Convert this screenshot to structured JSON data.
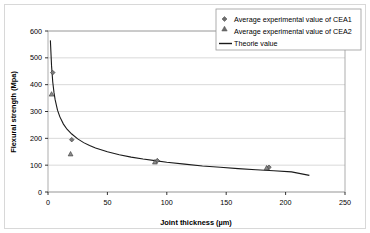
{
  "chart_data": {
    "type": "scatter",
    "title": "",
    "xlabel": "Joint thickness (µm)",
    "ylabel": "Flexural strength (Mpa)",
    "xlim": [
      0,
      250
    ],
    "ylim": [
      0,
      600
    ],
    "xticks": [
      "0",
      "50",
      "100",
      "150",
      "200",
      "250"
    ],
    "yticks": [
      "0",
      "100",
      "200",
      "300",
      "400",
      "500",
      "600"
    ],
    "grid": "horizontal",
    "legend_position": "top-right",
    "series": [
      {
        "name": "Average experimental value of CEA1",
        "marker": "diamond",
        "type": "scatter",
        "x": [
          4,
          20,
          92,
          186
        ],
        "values": [
          445,
          195,
          117,
          92
        ]
      },
      {
        "name": "Average experimental value of CEA2",
        "marker": "triangle",
        "type": "scatter",
        "x": [
          3,
          19,
          90,
          184
        ],
        "values": [
          365,
          142,
          112,
          90
        ]
      },
      {
        "name": "Theorie value",
        "marker": "line",
        "type": "line",
        "x": [
          2,
          3,
          4,
          5,
          6,
          8,
          10,
          13,
          16,
          20,
          25,
          30,
          35,
          40,
          50,
          60,
          70,
          80,
          90,
          100,
          115,
          130,
          145,
          160,
          175,
          190,
          205,
          220
        ],
        "values": [
          565,
          470,
          410,
          372,
          344,
          305,
          280,
          253,
          234,
          216,
          198,
          184,
          173,
          164,
          150,
          139,
          130,
          123,
          117,
          111,
          104,
          97,
          92,
          87,
          83,
          79,
          75,
          62
        ]
      }
    ]
  },
  "legend": {
    "items": [
      {
        "label": "Average experimental value of CEA1",
        "marker": "diamond"
      },
      {
        "label": "Average experimental value of CEA2",
        "marker": "triangle"
      },
      {
        "label": "Theorie value",
        "marker": "line"
      }
    ]
  },
  "axes": {
    "x_title": "Joint thickness (µm)",
    "y_title": "Flexural strength (Mpa)",
    "x_tick_labels": [
      "0",
      "50",
      "100",
      "150",
      "200",
      "250"
    ],
    "y_tick_labels": [
      "0",
      "100",
      "200",
      "300",
      "400",
      "500",
      "600"
    ]
  },
  "colors": {
    "axis": "#000000",
    "grid": "#c8c8c8",
    "curve": "#1a1a1a",
    "marker": "#4d4d4d",
    "frame": "#d8d8d8"
  }
}
